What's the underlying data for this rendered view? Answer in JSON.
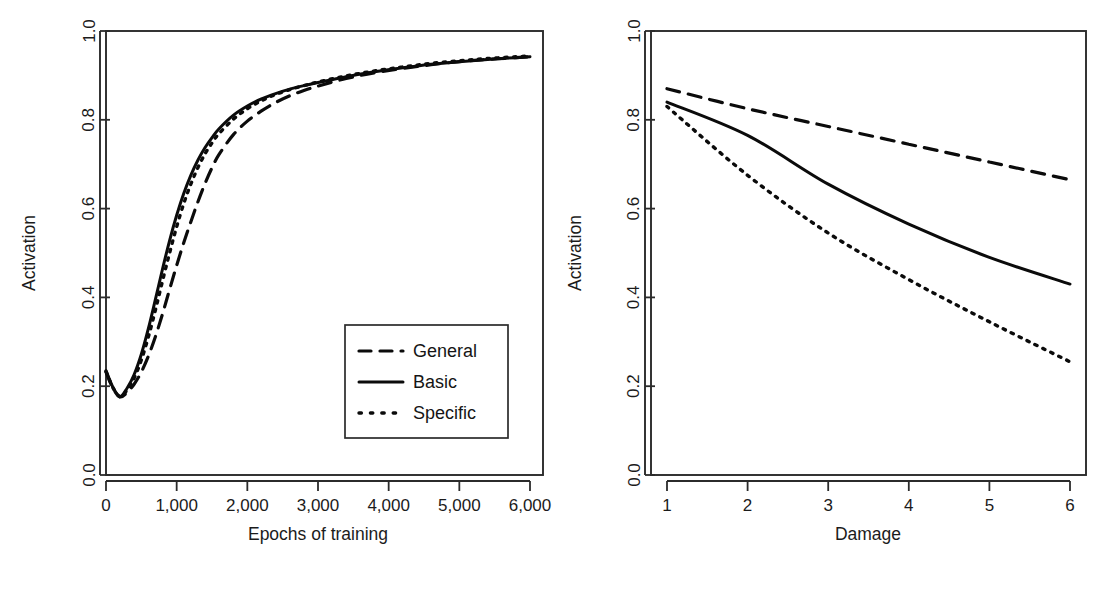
{
  "figure": {
    "title": "",
    "panels": [
      "epochs-panel",
      "damage-panel"
    ]
  },
  "legend": {
    "position": "bottom-right-of-left-panel",
    "entries": [
      {
        "label": "General",
        "style": "dashed"
      },
      {
        "label": "Basic",
        "style": "solid"
      },
      {
        "label": "Specific",
        "style": "dotted"
      }
    ]
  },
  "colors": {
    "ink": "#0b0b0b",
    "axis": "#2b2b2b",
    "background": "#ffffff"
  },
  "chart_data": [
    {
      "id": "epochs-panel",
      "type": "line",
      "title": "",
      "xlabel": "Epochs of training",
      "ylabel": "Activation",
      "xlim": [
        0,
        6000
      ],
      "ylim": [
        0.0,
        1.0
      ],
      "xticks": [
        0,
        1000,
        2000,
        3000,
        4000,
        5000,
        6000
      ],
      "xtick_labels": [
        "0",
        "1,000",
        "2,000",
        "3,000",
        "4,000",
        "5,000",
        "6,000"
      ],
      "yticks": [
        0.0,
        0.2,
        0.4,
        0.6,
        0.8,
        1.0
      ],
      "ytick_labels": [
        "0.0",
        "0.2",
        "0.4",
        "0.6",
        "0.8",
        "1.0"
      ],
      "grid": false,
      "legend": true,
      "x": [
        0,
        100,
        200,
        300,
        400,
        500,
        600,
        700,
        800,
        900,
        1000,
        1100,
        1200,
        1300,
        1400,
        1500,
        1600,
        1800,
        2000,
        2200,
        2400,
        2600,
        2800,
        3000,
        3400,
        3800,
        4200,
        4600,
        5000,
        5400,
        5800,
        6000
      ],
      "series": [
        {
          "name": "General",
          "style": "dashed",
          "values": [
            0.232,
            0.195,
            0.176,
            0.186,
            0.205,
            0.232,
            0.268,
            0.312,
            0.363,
            0.418,
            0.472,
            0.523,
            0.57,
            0.615,
            0.656,
            0.692,
            0.722,
            0.766,
            0.797,
            0.82,
            0.839,
            0.854,
            0.866,
            0.876,
            0.893,
            0.906,
            0.916,
            0.924,
            0.931,
            0.936,
            0.94,
            0.942
          ]
        },
        {
          "name": "Basic",
          "style": "solid",
          "values": [
            0.235,
            0.197,
            0.177,
            0.196,
            0.227,
            0.272,
            0.33,
            0.396,
            0.464,
            0.528,
            0.585,
            0.634,
            0.675,
            0.709,
            0.737,
            0.76,
            0.78,
            0.81,
            0.831,
            0.847,
            0.859,
            0.869,
            0.877,
            0.884,
            0.897,
            0.908,
            0.917,
            0.925,
            0.931,
            0.936,
            0.94,
            0.942
          ]
        },
        {
          "name": "Specific",
          "style": "dotted",
          "values": [
            0.233,
            0.196,
            0.176,
            0.192,
            0.219,
            0.259,
            0.311,
            0.372,
            0.437,
            0.5,
            0.559,
            0.611,
            0.655,
            0.692,
            0.723,
            0.748,
            0.769,
            0.801,
            0.825,
            0.843,
            0.857,
            0.868,
            0.877,
            0.885,
            0.899,
            0.91,
            0.919,
            0.927,
            0.933,
            0.938,
            0.942,
            0.944
          ]
        }
      ]
    },
    {
      "id": "damage-panel",
      "type": "line",
      "title": "",
      "xlabel": "Damage",
      "ylabel": "Activation",
      "xlim": [
        1,
        6
      ],
      "ylim": [
        0.0,
        1.0
      ],
      "xticks": [
        1,
        2,
        3,
        4,
        5,
        6
      ],
      "xtick_labels": [
        "1",
        "2",
        "3",
        "4",
        "5",
        "6"
      ],
      "yticks": [
        0.0,
        0.2,
        0.4,
        0.6,
        0.8,
        1.0
      ],
      "ytick_labels": [
        "0.0",
        "0.2",
        "0.4",
        "0.6",
        "0.8",
        "1.0"
      ],
      "grid": false,
      "legend": false,
      "x": [
        1,
        2,
        3,
        4,
        5,
        6
      ],
      "series": [
        {
          "name": "General",
          "style": "dashed",
          "values": [
            0.87,
            0.825,
            0.785,
            0.745,
            0.705,
            0.665
          ]
        },
        {
          "name": "Basic",
          "style": "solid",
          "values": [
            0.84,
            0.765,
            0.655,
            0.565,
            0.49,
            0.43
          ]
        },
        {
          "name": "Specific",
          "style": "dotted",
          "values": [
            0.83,
            0.675,
            0.545,
            0.44,
            0.345,
            0.255
          ]
        }
      ]
    }
  ]
}
